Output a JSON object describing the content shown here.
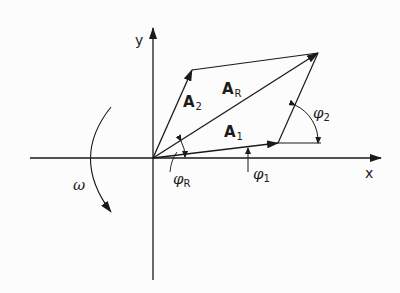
{
  "diagram": {
    "type": "phasor-vector-addition",
    "axes": {
      "x_label": "x",
      "y_label": "y"
    },
    "vectors": [
      {
        "id": "A1",
        "label": "A",
        "subscript": "1"
      },
      {
        "id": "A2",
        "label": "A",
        "subscript": "2"
      },
      {
        "id": "AR",
        "label": "A",
        "subscript": "R"
      }
    ],
    "angles": [
      {
        "id": "phi1",
        "symbol": "φ",
        "subscript": "1"
      },
      {
        "id": "phi2",
        "symbol": "φ",
        "subscript": "2"
      },
      {
        "id": "phiR",
        "symbol": "φ",
        "subscript": "R"
      }
    ],
    "rotation": {
      "symbol": "ω",
      "direction": "counterclockwise"
    },
    "colors": {
      "line": "#1a1a1a",
      "background": "#fcfcfc"
    }
  }
}
